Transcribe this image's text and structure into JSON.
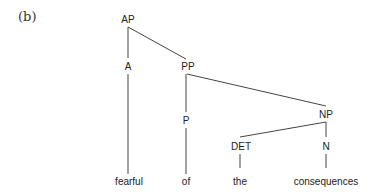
{
  "figure": {
    "caption": "(b)",
    "nodes": {
      "ap": "AP",
      "a": "A",
      "pp": "PP",
      "p": "P",
      "np": "NP",
      "det": "DET",
      "n": "N"
    },
    "leaves": {
      "fearful": "fearful",
      "of": "of",
      "the": "the",
      "consequences": "consequences"
    }
  }
}
